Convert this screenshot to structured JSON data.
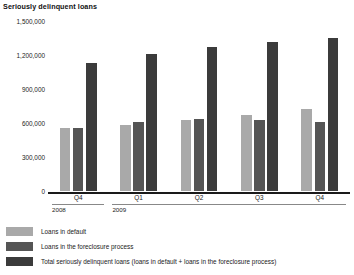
{
  "chart_data": {
    "type": "bar",
    "title": "Seriously delinquent loans",
    "xlabel": "",
    "ylabel": "",
    "ylim": [
      0,
      1500000
    ],
    "yticks": [
      0,
      300000,
      600000,
      900000,
      1200000,
      1500000
    ],
    "ytick_labels": [
      "0",
      "300,000",
      "600,000",
      "900,000",
      "1,200,000",
      "1,500,000"
    ],
    "grid": false,
    "legend_position": "below",
    "categories": [
      "Q4",
      "Q1",
      "Q2",
      "Q3",
      "Q4"
    ],
    "category_years": [
      "2008",
      "2009",
      "2009",
      "2009",
      "2009"
    ],
    "year_spans": [
      {
        "label": "2008",
        "start_index": 0,
        "end_index": 0
      },
      {
        "label": "2009",
        "start_index": 1,
        "end_index": 4
      }
    ],
    "series": [
      {
        "name": "Loans in default",
        "color": "#a9a9a9",
        "values": [
          570000,
          600000,
          640000,
          690000,
          740000
        ]
      },
      {
        "name": "Loans in the foreclosure process",
        "color": "#555555",
        "values": [
          575000,
          630000,
          650000,
          640000,
          630000
        ]
      },
      {
        "name": "Total seriously delinquent loans (loans in default + loans in the foreclosure process)",
        "color": "#3b3b3b",
        "values": [
          1150000,
          1230000,
          1290000,
          1330000,
          1370000
        ]
      }
    ]
  }
}
